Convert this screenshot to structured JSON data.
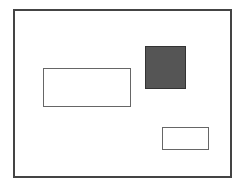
{
  "canvas": {
    "width": 241,
    "height": 187,
    "background": "#ffffff"
  },
  "shapes": [
    {
      "id": "outer-frame",
      "x": 13,
      "y": 9,
      "w": 219,
      "h": 169,
      "fill": "#ffffff",
      "stroke": "#444444",
      "stroke_width": 2
    },
    {
      "id": "dark-square",
      "x": 145,
      "y": 46,
      "w": 41,
      "h": 43,
      "fill": "#555555",
      "stroke": "#333333",
      "stroke_width": 1
    },
    {
      "id": "wide-rect",
      "x": 43,
      "y": 68,
      "w": 88,
      "h": 39,
      "fill": "#ffffff",
      "stroke": "#666666",
      "stroke_width": 1
    },
    {
      "id": "small-rect",
      "x": 162,
      "y": 127,
      "w": 47,
      "h": 23,
      "fill": "#ffffff",
      "stroke": "#666666",
      "stroke_width": 1
    }
  ]
}
